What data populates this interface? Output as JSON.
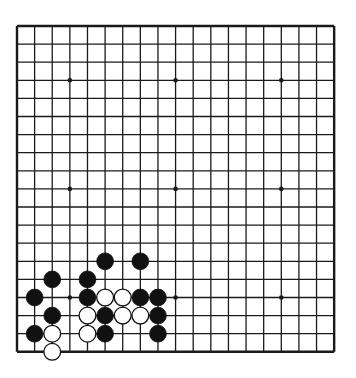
{
  "board": {
    "size": 19,
    "origin": {
      "x": 17,
      "y": 26
    },
    "spacing": {
      "x": 17.62,
      "y": 18.1
    },
    "line_color": "#1a1a1a",
    "background": "#ffffff",
    "star_points": [
      [
        3,
        3
      ],
      [
        3,
        9
      ],
      [
        3,
        15
      ],
      [
        9,
        3
      ],
      [
        9,
        9
      ],
      [
        9,
        15
      ],
      [
        15,
        3
      ],
      [
        15,
        9
      ],
      [
        15,
        15
      ]
    ],
    "stones": [
      {
        "color": "black",
        "col": 5,
        "row": 13
      },
      {
        "color": "black",
        "col": 7,
        "row": 13
      },
      {
        "color": "black",
        "col": 2,
        "row": 14
      },
      {
        "color": "black",
        "col": 4,
        "row": 14
      },
      {
        "color": "black",
        "col": 1,
        "row": 15
      },
      {
        "color": "black",
        "col": 4,
        "row": 15
      },
      {
        "color": "white",
        "col": 5,
        "row": 15
      },
      {
        "color": "white",
        "col": 6,
        "row": 15
      },
      {
        "color": "black",
        "col": 7,
        "row": 15
      },
      {
        "color": "black",
        "col": 8,
        "row": 15
      },
      {
        "color": "black",
        "col": 2,
        "row": 16
      },
      {
        "color": "white",
        "col": 4,
        "row": 16
      },
      {
        "color": "black",
        "col": 5,
        "row": 16
      },
      {
        "color": "white",
        "col": 6,
        "row": 16
      },
      {
        "color": "white",
        "col": 7,
        "row": 16
      },
      {
        "color": "black",
        "col": 8,
        "row": 16
      },
      {
        "color": "black",
        "col": 1,
        "row": 17
      },
      {
        "color": "white",
        "col": 2,
        "row": 17
      },
      {
        "color": "white",
        "col": 4,
        "row": 17
      },
      {
        "color": "black",
        "col": 5,
        "row": 17
      },
      {
        "color": "black",
        "col": 8,
        "row": 17
      },
      {
        "color": "white",
        "col": 2,
        "row": 18
      }
    ]
  }
}
